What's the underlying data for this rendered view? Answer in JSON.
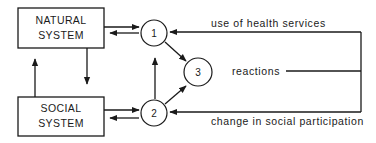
{
  "diagram": {
    "boxes": {
      "natural": {
        "line1": "NATURAL",
        "line2": "SYSTEM"
      },
      "social": {
        "line1": "SOCIAL",
        "line2": "SYSTEM"
      }
    },
    "nodes": {
      "n1": "1",
      "n2": "2",
      "n3": "3"
    },
    "labels": {
      "use_of_health_services": "use of health services",
      "reactions": "reactions",
      "change_in_social_participation": "change in social participation"
    },
    "colors": {
      "ink": "#1a1a1a",
      "background": "#ffffff"
    }
  }
}
